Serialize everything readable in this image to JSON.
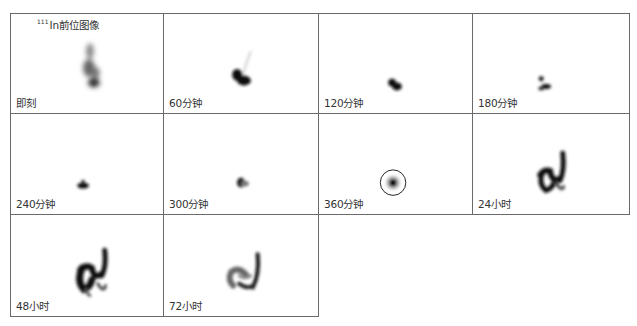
{
  "figure": {
    "title_isotope_mass": "111",
    "title_text": "In前位图像",
    "panels": [
      {
        "label": "即刻"
      },
      {
        "label": "60分钟"
      },
      {
        "label": "120分钟"
      },
      {
        "label": "180分钟"
      },
      {
        "label": "240分钟"
      },
      {
        "label": "300分钟"
      },
      {
        "label": "360分钟"
      },
      {
        "label": "24小时"
      },
      {
        "label": "48小时"
      },
      {
        "label": "72小时"
      }
    ]
  }
}
